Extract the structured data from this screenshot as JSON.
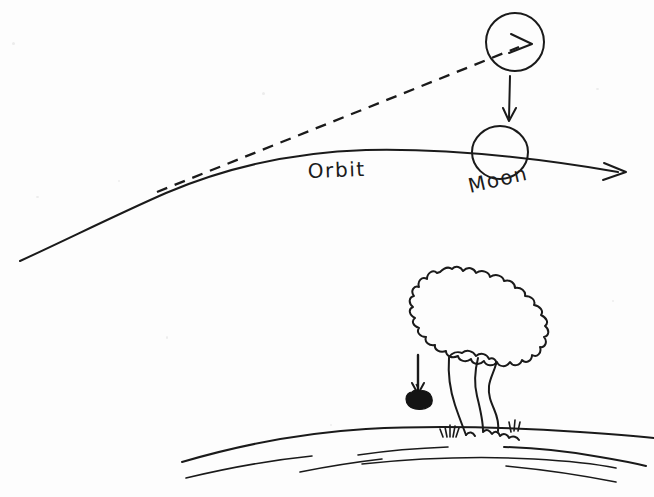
{
  "canvas": {
    "width": 654,
    "height": 497,
    "background_color": "#fdfdfd",
    "ink_color": "#1a1a1a",
    "style": "hand-drawn pen sketch on white paper"
  },
  "labels": {
    "orbit": "Orbit",
    "moon": "Moon"
  },
  "elements": {
    "orbit_curve": {
      "name": "orbit-curve",
      "description": "long gentle arc sweeping from lower-left to right, ending in an arrowhead",
      "start": [
        20,
        261
      ],
      "end": [
        628,
        172
      ],
      "has_arrowhead": true
    },
    "tangent_line": {
      "name": "tangent-dashed-line",
      "description": "dashed straight line tangent to the orbit, rising to the upper circle, ending in an arrowhead",
      "start": [
        157,
        192
      ],
      "end": [
        530,
        44
      ],
      "dashed": true,
      "has_arrowhead": true
    },
    "projectile_circle": {
      "name": "projectile-circle",
      "center": [
        515,
        42
      ],
      "radius": 29
    },
    "moon_circle": {
      "name": "moon-circle",
      "center": [
        500,
        152
      ],
      "radius": 27
    },
    "fall_arrow_moon": {
      "name": "moon-fall-arrow",
      "description": "vertical arrow from the projectile circle down toward the moon",
      "start": [
        510,
        76
      ],
      "end": [
        509,
        122
      ]
    },
    "fall_arrow_apple": {
      "name": "apple-fall-arrow",
      "description": "vertical arrow above the apple showing it falling",
      "start": [
        418,
        355
      ],
      "end": [
        418,
        395
      ]
    },
    "apple": {
      "name": "apple",
      "center": [
        419,
        399
      ],
      "filled": true,
      "color": "#141414"
    },
    "tree": {
      "name": "tree",
      "canopy_bounds": [
        385,
        266,
        549,
        372
      ],
      "trunk_bounds": [
        448,
        352,
        505,
        437
      ]
    },
    "ground": {
      "name": "earth-surface",
      "description": "curved horizon line of the Earth with several parallel contour strokes beneath",
      "horizon_start": [
        182,
        462
      ],
      "horizon_end": [
        654,
        437
      ],
      "contour_line_count": 6
    },
    "grass": {
      "name": "grass-tufts",
      "count": 2
    }
  },
  "counts": {
    "circles": 2,
    "arrows": 4,
    "text_labels": 2
  }
}
